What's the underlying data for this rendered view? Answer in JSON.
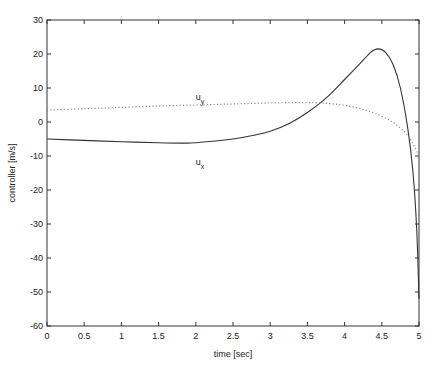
{
  "chart_data": {
    "type": "line",
    "title": "",
    "xlabel": "time [sec]",
    "ylabel": "controller [m/s]",
    "xlim": [
      0,
      5
    ],
    "ylim": [
      -60,
      30
    ],
    "xticks": [
      0,
      0.5,
      1,
      1.5,
      2,
      2.5,
      3,
      3.5,
      4,
      4.5,
      5
    ],
    "xtick_labels": [
      "0",
      "0.5",
      "1",
      "1.5",
      "2",
      "2.5",
      "3",
      "3.5",
      "4",
      "4.5",
      "5"
    ],
    "yticks": [
      -60,
      -50,
      -40,
      -30,
      -20,
      -10,
      0,
      10,
      20,
      30
    ],
    "ytick_labels": [
      "-60",
      "-50",
      "-40",
      "-30",
      "-20",
      "-10",
      "0",
      "10",
      "20",
      "30"
    ],
    "grid": false,
    "legend": "none (inline annotations)",
    "annotations": [
      {
        "text": "u",
        "sub": "y",
        "x": 2.0,
        "y": 6.5,
        "series": "u_y"
      },
      {
        "text": "u",
        "sub": "x",
        "x": 2.0,
        "y": -12.5,
        "series": "u_x"
      }
    ],
    "series": [
      {
        "name": "u_x",
        "style": "solid",
        "color": "#333333",
        "x": [
          0,
          0.5,
          1.0,
          1.5,
          1.8,
          2.0,
          2.5,
          2.8,
          3.0,
          3.25,
          3.5,
          3.75,
          4.0,
          4.2,
          4.35,
          4.45,
          4.55,
          4.65,
          4.75,
          4.85,
          4.92,
          4.97,
          5.0
        ],
        "y": [
          -5,
          -5.4,
          -5.8,
          -6.1,
          -6.2,
          -6.1,
          -5.0,
          -3.8,
          -2.7,
          -0.5,
          2.8,
          7.0,
          12.5,
          17.0,
          20.5,
          21.5,
          20.5,
          17.0,
          10.0,
          -2.0,
          -15.0,
          -32.0,
          -52.0
        ]
      },
      {
        "name": "u_y",
        "style": "dotted",
        "color": "#888888",
        "x": [
          0,
          0.5,
          1.0,
          1.5,
          2.0,
          2.5,
          3.0,
          3.5,
          3.8,
          4.0,
          4.2,
          4.4,
          4.6,
          4.75,
          4.85,
          4.92,
          5.0
        ],
        "y": [
          3.5,
          3.9,
          4.3,
          4.7,
          5.0,
          5.3,
          5.6,
          5.7,
          5.4,
          4.9,
          4.0,
          2.6,
          0.6,
          -1.8,
          -4.0,
          -6.5,
          -10.0
        ]
      }
    ]
  },
  "labels": {
    "xlabel": "time [sec]",
    "ylabel": "controller [m/s]",
    "uy_main": "u",
    "uy_sub": "y",
    "ux_main": "u",
    "ux_sub": "x"
  }
}
